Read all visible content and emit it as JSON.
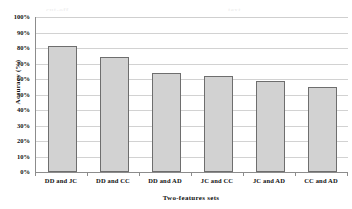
{
  "chart_data": {
    "type": "bar",
    "title": "",
    "categories": [
      "DD and JC",
      "DD and CC",
      "DD and AD",
      "JC and CC",
      "JC and AD",
      "CC and AD"
    ],
    "values": [
      81,
      74.5,
      64,
      62,
      58.5,
      55
    ],
    "xlabel": "Two-features sets",
    "ylabel": "Accuracy (%)",
    "ylim": [
      0,
      100
    ],
    "ytick_labels": [
      "100%",
      "90%",
      "80%",
      "70%",
      "60%",
      "50%",
      "40%",
      "30%",
      "20%",
      "10%",
      "0%"
    ],
    "ytick_values": [
      100,
      90,
      80,
      70,
      60,
      50,
      40,
      30,
      20,
      10,
      0
    ],
    "grid": true,
    "legend": "none",
    "series": [
      {
        "name": "Accuracy",
        "values": [
          81,
          74.5,
          64,
          62,
          58.5,
          55
        ],
        "bar_fill_color": "#d2d2d2",
        "bar_border_color": "#6e6e6e"
      }
    ],
    "axis_color": "#8c8c8c",
    "gridline_color": "#d2d2d2",
    "background_color": "#ffffff"
  },
  "ghost_text": {
    "left_fragment": "cut-off",
    "right_fragment": "text"
  }
}
